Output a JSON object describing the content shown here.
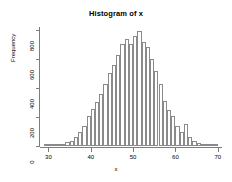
{
  "chart_data": {
    "type": "bar",
    "title": "Histogram of x",
    "xlabel": "x",
    "ylabel": "Frequency",
    "grid": false,
    "legend": "none",
    "binwidth": 1,
    "xlim": [
      28,
      71
    ],
    "ylim": [
      0,
      820
    ],
    "xticks": [
      30,
      40,
      50,
      60,
      70
    ],
    "yticks": [
      0,
      200,
      400,
      600,
      800
    ],
    "categories": [
      29,
      30,
      31,
      32,
      33,
      34,
      35,
      36,
      37,
      38,
      39,
      40,
      41,
      42,
      43,
      44,
      45,
      46,
      47,
      48,
      49,
      50,
      51,
      52,
      53,
      54,
      55,
      56,
      57,
      58,
      59,
      60,
      61,
      62,
      63,
      64,
      65,
      66,
      67,
      68,
      69
    ],
    "values": [
      2,
      4,
      7,
      10,
      16,
      25,
      38,
      62,
      95,
      140,
      205,
      255,
      300,
      360,
      430,
      500,
      560,
      625,
      700,
      735,
      700,
      755,
      790,
      715,
      680,
      600,
      520,
      430,
      310,
      245,
      205,
      140,
      100,
      150,
      60,
      35,
      20,
      12,
      7,
      4,
      2
    ]
  }
}
